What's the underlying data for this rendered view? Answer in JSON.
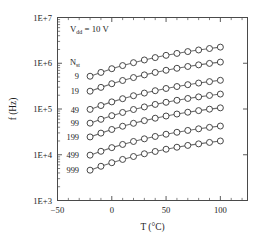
{
  "chart_data": {
    "type": "line",
    "title": "",
    "xlabel": "T (°C)",
    "ylabel": "f (Hz)",
    "yscale": "log",
    "xscale": "linear",
    "xlim": [
      -50,
      125
    ],
    "ylim": [
      1000,
      10000000
    ],
    "grid": false,
    "legend_position": "inside-left-column",
    "xticks": [
      -50,
      0,
      50,
      100
    ],
    "xticklabels": [
      "−50",
      "0",
      "50",
      "100"
    ],
    "xtick_minor_step": 10,
    "yticks": [
      1000,
      10000,
      100000,
      1000000,
      10000000
    ],
    "yticklabels": [
      "1E+3",
      "1E+4",
      "1E+5",
      "1E+6",
      "1E+7"
    ],
    "annotations": [
      {
        "text": "V",
        "sub": "dd",
        "rest": " = 10 V",
        "full": "Vdd = 10 V"
      }
    ],
    "series_group_label": "N",
    "series_group_sub": "st",
    "x": [
      -20,
      -10,
      0,
      10,
      20,
      30,
      40,
      50,
      60,
      70,
      80,
      90,
      100
    ],
    "series": [
      {
        "name": "9",
        "values": [
          520000.0,
          630000.0,
          760000.0,
          890000.0,
          1030000.0,
          1180000.0,
          1330000.0,
          1490000.0,
          1640000.0,
          1800000.0,
          1950000.0,
          2100000.0,
          2250000.0
        ]
      },
      {
        "name": "19",
        "values": [
          245000.0,
          297000.0,
          357000.0,
          420000.0,
          487000.0,
          557000.0,
          629000.0,
          702000.0,
          776000.0,
          850000.0,
          922000.0,
          992000.0,
          1060000.0
        ]
      },
      {
        "name": "49",
        "values": [
          98000.0,
          119000.0,
          143000.0,
          168000.0,
          195000.0,
          223000.0,
          251000.0,
          281000.0,
          310000.0,
          340000.0,
          369000.0,
          397000.0,
          424000.0
        ]
      },
      {
        "name": "99",
        "values": [
          49000.0,
          59500.0,
          71500.0,
          84000.0,
          97500.0,
          111000.0,
          126000.0,
          140000.0,
          155000.0,
          170000.0,
          184000.0,
          198000.0,
          212000.0
        ]
      },
      {
        "name": "199",
        "values": [
          24500.0,
          29700.0,
          35700.0,
          42000.0,
          48700.0,
          55700.0,
          62900.0,
          70200.0,
          77600.0,
          85000.0,
          92200.0,
          99200.0,
          106000.0
        ]
      },
      {
        "name": "499",
        "values": [
          9800.0,
          11900.0,
          14300.0,
          16800.0,
          19500.0,
          22300.0,
          25100.0,
          28100.0,
          31000.0,
          34000.0,
          36900.0,
          39700.0,
          42400.0
        ]
      },
      {
        "name": "999",
        "values": [
          4600.0,
          5600.0,
          6700.0,
          7900.0,
          9150.0,
          10500.0,
          11800.0,
          13200.0,
          14600.0,
          16000.0,
          17300.0,
          18600.0,
          20000.0
        ]
      }
    ],
    "series_label_positions": [
      {
        "name": "9",
        "y": 520000.0
      },
      {
        "name": "19",
        "y": 245000.0
      },
      {
        "name": "49",
        "y": 98000.0
      },
      {
        "name": "99",
        "y": 49000.0
      },
      {
        "name": "199",
        "y": 24500.0
      },
      {
        "name": "499",
        "y": 9800.0
      },
      {
        "name": "999",
        "y": 4600.0
      }
    ],
    "marker": "open-circle",
    "line_color": "#6e6e6e",
    "marker_edge_color": "#3d3d3d",
    "marker_face_color": "#ffffff"
  }
}
